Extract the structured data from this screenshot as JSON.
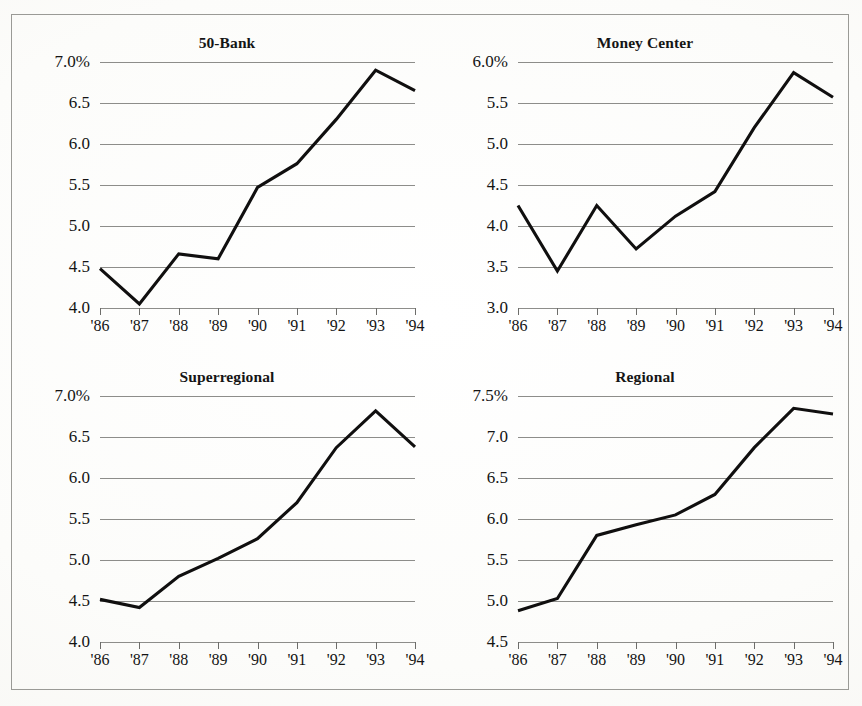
{
  "figure": {
    "background_color": "#fbfbf9",
    "frame_color": "#9a9a96",
    "line_color": "#100f0f",
    "gridline_color": "#8d8d8a"
  },
  "chart_data": [
    {
      "type": "line",
      "title": "50-Bank",
      "xlabel": "",
      "ylabel": "",
      "grid": true,
      "legend": "none",
      "x": [
        "'86",
        "'87",
        "'88",
        "'89",
        "'90",
        "'91",
        "'92",
        "'93",
        "'94"
      ],
      "categories": [
        "'86",
        "'87",
        "'88",
        "'89",
        "'90",
        "'91",
        "'92",
        "'93",
        "'94"
      ],
      "values": [
        4.48,
        4.05,
        4.66,
        4.6,
        5.47,
        5.76,
        6.3,
        6.9,
        6.65
      ],
      "ylim": [
        4.0,
        7.0
      ],
      "yticks": [
        4.0,
        4.5,
        5.0,
        5.5,
        6.0,
        6.5,
        7.0
      ],
      "ytick_labels": [
        "4.0",
        "4.5",
        "5.0",
        "5.5",
        "6.0",
        "6.5",
        "7.0%"
      ]
    },
    {
      "type": "line",
      "title": "Money Center",
      "xlabel": "",
      "ylabel": "",
      "grid": true,
      "legend": "none",
      "x": [
        "'86",
        "'87",
        "'88",
        "'89",
        "'90",
        "'91",
        "'92",
        "'93",
        "'94"
      ],
      "categories": [
        "'86",
        "'87",
        "'88",
        "'89",
        "'90",
        "'91",
        "'92",
        "'93",
        "'94"
      ],
      "values": [
        4.25,
        3.45,
        4.25,
        3.72,
        4.12,
        4.42,
        5.2,
        5.87,
        5.57
      ],
      "ylim": [
        3.0,
        6.0
      ],
      "yticks": [
        3.0,
        3.5,
        4.0,
        4.5,
        5.0,
        5.5,
        6.0
      ],
      "ytick_labels": [
        "3.0",
        "3.5",
        "4.0",
        "4.5",
        "5.0",
        "5.5",
        "6.0%"
      ]
    },
    {
      "type": "line",
      "title": "Superregional",
      "xlabel": "",
      "ylabel": "",
      "grid": true,
      "legend": "none",
      "x": [
        "'86",
        "'87",
        "'88",
        "'89",
        "'90",
        "'91",
        "'92",
        "'93",
        "'94"
      ],
      "categories": [
        "'86",
        "'87",
        "'88",
        "'89",
        "'90",
        "'91",
        "'92",
        "'93",
        "'94"
      ],
      "values": [
        4.52,
        4.42,
        4.8,
        5.02,
        5.26,
        5.7,
        6.37,
        6.82,
        6.38
      ],
      "ylim": [
        4.0,
        7.0
      ],
      "yticks": [
        4.0,
        4.5,
        5.0,
        5.5,
        6.0,
        6.5,
        7.0
      ],
      "ytick_labels": [
        "4.0",
        "4.5",
        "5.0",
        "5.5",
        "6.0",
        "6.5",
        "7.0%"
      ]
    },
    {
      "type": "line",
      "title": "Regional",
      "xlabel": "",
      "ylabel": "",
      "grid": true,
      "legend": "none",
      "x": [
        "'86",
        "'87",
        "'88",
        "'89",
        "'90",
        "'91",
        "'92",
        "'93",
        "'94"
      ],
      "categories": [
        "'86",
        "'87",
        "'88",
        "'89",
        "'90",
        "'91",
        "'92",
        "'93",
        "'94"
      ],
      "values": [
        4.88,
        5.03,
        5.8,
        5.93,
        6.05,
        6.3,
        6.87,
        7.35,
        7.28
      ],
      "ylim": [
        4.5,
        7.5
      ],
      "yticks": [
        4.5,
        5.0,
        5.5,
        6.0,
        6.5,
        7.0,
        7.5
      ],
      "ytick_labels": [
        "4.5",
        "5.0",
        "5.5",
        "6.0",
        "6.5",
        "7.0",
        "7.5%"
      ]
    }
  ],
  "panels": [
    {
      "title": "50-Bank"
    },
    {
      "title": "Money Center"
    },
    {
      "title": "Superregional"
    },
    {
      "title": "Regional"
    }
  ]
}
